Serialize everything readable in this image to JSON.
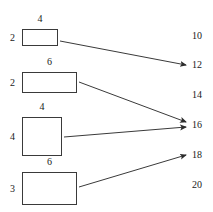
{
  "diagram": {
    "stroke_color": "#3a3a3a",
    "text_color": "#1a1a1a",
    "background_color": "#ffffff",
    "boxes": [
      {
        "id": "box-1",
        "top_label": "4",
        "left_label": "2",
        "x": 22,
        "y": 29,
        "w": 36,
        "h": 17
      },
      {
        "id": "box-2",
        "top_label": "6",
        "left_label": "2",
        "x": 22,
        "y": 72,
        "w": 55,
        "h": 21
      },
      {
        "id": "box-3",
        "top_label": "4",
        "left_label": "4",
        "x": 22,
        "y": 117,
        "w": 40,
        "h": 39
      },
      {
        "id": "box-4",
        "top_label": "6",
        "left_label": "3",
        "x": 22,
        "y": 172,
        "w": 55,
        "h": 33
      }
    ],
    "values": [
      {
        "id": "value-10",
        "label": "10",
        "x": 192,
        "y": 36
      },
      {
        "id": "value-12",
        "label": "12",
        "x": 192,
        "y": 65
      },
      {
        "id": "value-14",
        "label": "14",
        "x": 192,
        "y": 95
      },
      {
        "id": "value-16",
        "label": "16",
        "x": 192,
        "y": 125
      },
      {
        "id": "value-18",
        "label": "18",
        "x": 192,
        "y": 155
      },
      {
        "id": "value-20",
        "label": "20",
        "x": 192,
        "y": 185
      }
    ],
    "arrows": [
      {
        "id": "arrow-box1-to-12",
        "from_box": "box-1",
        "to_value": "12",
        "x1": 60,
        "y1": 41,
        "x2": 186,
        "y2": 65
      },
      {
        "id": "arrow-box2-to-16",
        "from_box": "box-2",
        "to_value": "16",
        "x1": 79,
        "y1": 82,
        "x2": 186,
        "y2": 122
      },
      {
        "id": "arrow-box3-to-16",
        "from_box": "box-3",
        "to_value": "16",
        "x1": 64,
        "y1": 137,
        "x2": 186,
        "y2": 127
      },
      {
        "id": "arrow-box4-to-18",
        "from_box": "box-4",
        "to_value": "18",
        "x1": 79,
        "y1": 187,
        "x2": 186,
        "y2": 155
      }
    ]
  }
}
